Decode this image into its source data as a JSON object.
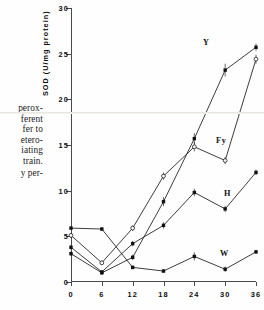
{
  "caption": {
    "lines": [
      "perox-",
      "ferent",
      "fer to",
      "etero-",
      "iating",
      "train."
    ],
    "last_line": "y per-"
  },
  "chart_data": {
    "type": "line",
    "title": "",
    "xlabel": "",
    "ylabel": "SOD (U/mg protein)",
    "x": [
      0,
      6,
      12,
      18,
      24,
      30,
      36
    ],
    "xlim": [
      0,
      36
    ],
    "ylim": [
      0,
      30
    ],
    "xticks": [
      0,
      6,
      12,
      18,
      24,
      30,
      36
    ],
    "xticklabels": [
      "0",
      "6",
      "12",
      "18",
      "24",
      "30",
      "36"
    ],
    "yticks": [
      0,
      5,
      10,
      15,
      20,
      25,
      30
    ],
    "yticklabels": [
      "0",
      "5",
      "10",
      "15",
      "20",
      "25",
      "30"
    ],
    "grid": false,
    "legend_position": "inline-annotation",
    "series": [
      {
        "name": "Y",
        "marker": "filled-square",
        "label": "Y",
        "values": [
          3.1,
          1.0,
          2.7,
          8.8,
          15.7,
          23.2,
          25.7
        ],
        "errors": [
          0.25,
          0.2,
          0.3,
          0.5,
          0.6,
          0.7,
          0.4
        ]
      },
      {
        "name": "Fy",
        "marker": "open-circle",
        "label": "Fy",
        "values": [
          5.1,
          2.1,
          5.9,
          11.6,
          14.8,
          13.3,
          24.4
        ],
        "errors": [
          0.3,
          0.25,
          0.3,
          0.4,
          0.5,
          0.4,
          0.5
        ]
      },
      {
        "name": "H",
        "marker": "filled-square",
        "label": "H",
        "values": [
          3.8,
          1.1,
          4.2,
          6.2,
          9.8,
          8.0,
          12.0
        ],
        "errors": [
          0.25,
          0.2,
          0.3,
          0.35,
          0.4,
          0.35,
          0.3
        ]
      },
      {
        "name": "W",
        "marker": "filled-square",
        "label": "W",
        "values": [
          5.9,
          5.8,
          1.6,
          1.2,
          2.8,
          1.4,
          3.3
        ],
        "errors": [
          0.2,
          0.2,
          0.2,
          0.2,
          0.45,
          0.3,
          0.2
        ]
      }
    ]
  }
}
